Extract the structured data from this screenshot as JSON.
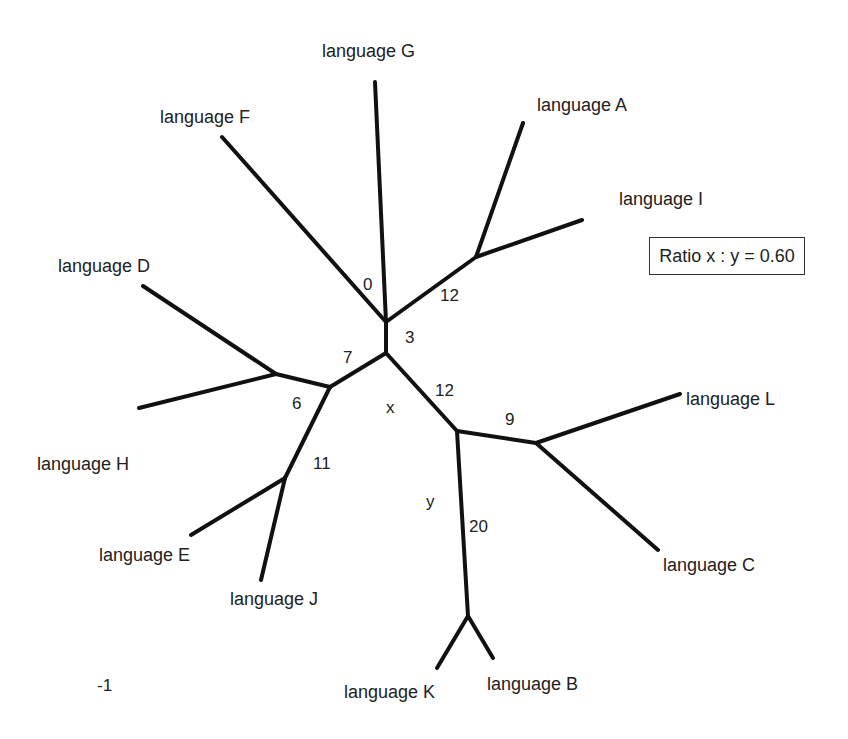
{
  "diagram": {
    "type": "unrooted phylogenetic tree",
    "ratio_box": "Ratio x : y = 0.60",
    "page_marker": "-1",
    "leaves": [
      {
        "id": "G",
        "label": "language G"
      },
      {
        "id": "F",
        "label": "language F"
      },
      {
        "id": "A",
        "label": "language A"
      },
      {
        "id": "I",
        "label": "language I"
      },
      {
        "id": "D",
        "label": "language D"
      },
      {
        "id": "H",
        "label": "language H"
      },
      {
        "id": "E",
        "label": "language E"
      },
      {
        "id": "J",
        "label": "language J"
      },
      {
        "id": "L",
        "label": "language L"
      },
      {
        "id": "C",
        "label": "language C"
      },
      {
        "id": "K",
        "label": "language K"
      },
      {
        "id": "B",
        "label": "language B"
      }
    ],
    "edge_labels": [
      {
        "id": "e0",
        "text": "0"
      },
      {
        "id": "e12a",
        "text": "12"
      },
      {
        "id": "e3",
        "text": "3"
      },
      {
        "id": "e7",
        "text": "7"
      },
      {
        "id": "e6",
        "text": "6"
      },
      {
        "id": "e11",
        "text": "11"
      },
      {
        "id": "e12b",
        "text": "12"
      },
      {
        "id": "e9",
        "text": "9"
      },
      {
        "id": "e20",
        "text": "20"
      },
      {
        "id": "x",
        "text": "x"
      },
      {
        "id": "y",
        "text": "y"
      }
    ],
    "colors": {
      "line": "#111111",
      "text": "#222222",
      "background": "#ffffff"
    }
  }
}
